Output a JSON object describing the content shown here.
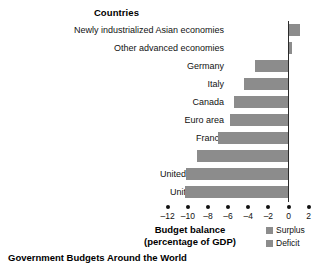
{
  "caption": "Government Budgets Around the World",
  "legend": {
    "items": [
      {
        "label": "Surplus",
        "color": "#8c8c8c",
        "swatch_icon": "square-swatch-icon"
      },
      {
        "label": "Deficit",
        "color": "#8c8c8c",
        "swatch_icon": "square-swatch-icon"
      }
    ]
  },
  "chart_data": {
    "type": "bar",
    "orientation": "horizontal",
    "title": "Countries",
    "xlabel": "Budget balance (percentage of GDP)",
    "xlabel_line1": "Budget balance",
    "xlabel_line2": "(percentage of GDP)",
    "ylabel": "Countries",
    "categories": [
      "Newly industrialized Asian economies",
      "Other advanced economies",
      "Germany",
      "Italy",
      "Canada",
      "Euro area",
      "France",
      "Japan",
      "United Kingdom",
      "United States"
    ],
    "values": [
      1.1,
      0.3,
      -3.3,
      -4.4,
      -5.4,
      -5.8,
      -7.0,
      -9.1,
      -10.2,
      -10.3
    ],
    "xlim": [
      -13,
      2.5
    ],
    "ticks": [
      -12,
      -10,
      -8,
      -6,
      -4,
      -2,
      0,
      2
    ],
    "tick_labels": [
      "–12",
      "–10",
      "–8",
      "–6",
      "–4",
      "–2",
      "0",
      "2"
    ],
    "grid": false,
    "legend_position": "bottom-right",
    "bar_color": "#8c8c8c",
    "axis_color": "#2b2b2b"
  }
}
